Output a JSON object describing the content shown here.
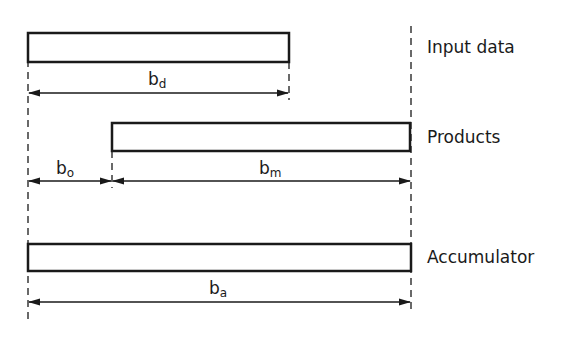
{
  "diagram": {
    "rows": [
      {
        "label": "Input data",
        "dimension": {
          "symbol": "b",
          "subscript": "d"
        }
      },
      {
        "label": "Products",
        "dimensions": [
          {
            "symbol": "b",
            "subscript": "o"
          },
          {
            "symbol": "b",
            "subscript": "m"
          }
        ]
      },
      {
        "label": "Accumulator",
        "dimension": {
          "symbol": "b",
          "subscript": "a"
        }
      }
    ],
    "colors": {
      "stroke": "#1a1a1a",
      "background": "#ffffff"
    }
  }
}
